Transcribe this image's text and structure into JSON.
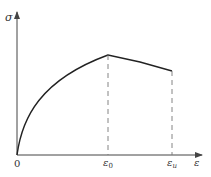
{
  "diagram": {
    "y_axis_label": "σ",
    "x_axis_label": "ε",
    "origin_label": "0",
    "ticks": [
      {
        "label": "ε",
        "sub": "0"
      },
      {
        "label": "ε",
        "sub": "u"
      }
    ],
    "curve": {
      "rising_segment": "concave parabolic rise from origin to peak at ε0",
      "falling_segment": "near-linear descent from ε0 to εu"
    },
    "colors": {
      "line": "#222222",
      "axis": "#444444",
      "dash": "#777777"
    }
  }
}
